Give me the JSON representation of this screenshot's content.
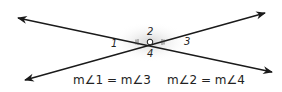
{
  "diagram": {
    "angle_labels": [
      "1",
      "2",
      "3",
      "4"
    ],
    "equations": [
      "m∠1 = m∠3",
      "m∠2 = m∠4"
    ],
    "colors": {
      "line": "#1a1a1a",
      "highlight": "#d9d9d9"
    }
  }
}
